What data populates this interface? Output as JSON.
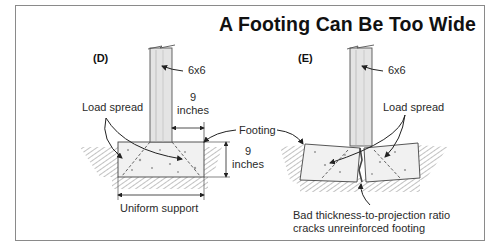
{
  "title": "A Footing Can Be Too Wide",
  "panels": [
    {
      "id": "D",
      "label": "(D)",
      "post_label": "6x6",
      "load_label": "Load spread",
      "projection_dim": "9",
      "projection_unit": "inches",
      "thickness_dim": "9",
      "thickness_unit": "inches",
      "support_label": "Uniform support"
    },
    {
      "id": "E",
      "label": "(E)",
      "post_label": "6x6",
      "load_label": "Load spread",
      "failure_line1": "Bad thickness-to-projection ratio",
      "failure_line2": "cracks unreinforced footing"
    }
  ],
  "shared": {
    "footing_label": "Footing"
  },
  "colors": {
    "frame": "#8a8a8a",
    "line": "#333333",
    "ground": "#8c8c8c",
    "concrete": "#f1f1f1",
    "post": "#e4e4e4"
  }
}
